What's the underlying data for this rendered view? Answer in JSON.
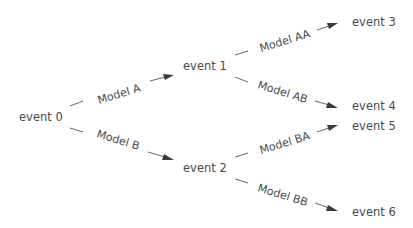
{
  "diagram": {
    "type": "tree",
    "nodes": [
      {
        "id": "e0",
        "label": "event 0"
      },
      {
        "id": "e1",
        "label": "event 1"
      },
      {
        "id": "e2",
        "label": "event 2"
      },
      {
        "id": "e3",
        "label": "event 3"
      },
      {
        "id": "e4",
        "label": "event 4"
      },
      {
        "id": "e5",
        "label": "event 5"
      },
      {
        "id": "e6",
        "label": "event 6"
      }
    ],
    "edges": [
      {
        "from": "e0",
        "to": "e1",
        "label": "Model A"
      },
      {
        "from": "e0",
        "to": "e2",
        "label": "Model B"
      },
      {
        "from": "e1",
        "to": "e3",
        "label": "Model AA"
      },
      {
        "from": "e1",
        "to": "e4",
        "label": "Model AB"
      },
      {
        "from": "e2",
        "to": "e5",
        "label": "Model BA"
      },
      {
        "from": "e2",
        "to": "e6",
        "label": "Model BB"
      }
    ]
  }
}
